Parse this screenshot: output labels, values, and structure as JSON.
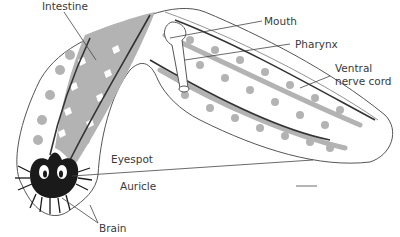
{
  "diagram": {
    "colors": {
      "outline": "#555555",
      "intestine_fill": "#b3b3b3",
      "nerve_cord": "#333333",
      "brain": "#1a1a1a",
      "label_text": "#3a3a3a"
    },
    "labels": [
      {
        "id": "intestine",
        "text": "Intestine"
      },
      {
        "id": "mouth",
        "text": "Mouth"
      },
      {
        "id": "pharynx",
        "text": "Pharynx"
      },
      {
        "id": "ventral_nerve_cord_line1",
        "text": "Ventral"
      },
      {
        "id": "ventral_nerve_cord_line2",
        "text": "nerve cord"
      },
      {
        "id": "eyespot",
        "text": "Eyespot"
      },
      {
        "id": "auricle",
        "text": "Auricle"
      },
      {
        "id": "brain",
        "text": "Brain"
      }
    ]
  }
}
